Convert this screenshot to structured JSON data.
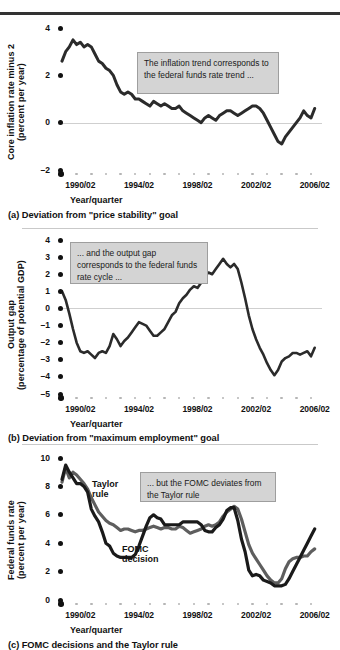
{
  "figure": {
    "panels": [
      {
        "id": "a",
        "caption": "(a) Deviation from \"price stability\" goal",
        "callout": "The inflation trend corresponds to the federal funds rate trend ...",
        "xaxis_title": "Year/quarter",
        "ylabel_line1": "Core inflation rate minus 2",
        "ylabel_line2": "(percent per year)"
      },
      {
        "id": "b",
        "caption": "(b) Deviation from \"maximum employment\" goal",
        "callout": "... and the output gap corresponds to the federal funds rate cycle ...",
        "xaxis_title": "Year/quarter",
        "ylabel_line1": "Output gap",
        "ylabel_line2": "(percentage of potential GDP)"
      },
      {
        "id": "c",
        "caption": "(c) FOMC decisions and the Taylor rule",
        "callout": "... but the FOMC deviates from the Taylor rule",
        "xaxis_title": "Year/quarter",
        "ylabel_line1": "Federal funds rate",
        "ylabel_line2": "(percent per year)",
        "label_taylor": "Taylor\nrule",
        "label_fomc": "FOMC\ndecision"
      }
    ]
  },
  "colors": {
    "series_dark": "#2b2b2b",
    "series_gray": "#5e5e5e",
    "callout_bg": "#d4d4d4",
    "callout_border": "#9e9e9e",
    "zero_line": "#cfcfcf",
    "tick_major": "#111111",
    "tick_minor": "#b5b5b5",
    "rule_top": "#333333",
    "rule_panel": "#c9c9c9"
  },
  "chart_data": [
    {
      "type": "line",
      "id": "panel-a",
      "title": "(a) Deviation from \"price stability\" goal",
      "xlabel": "Year/quarter",
      "ylabel": "Core inflation rate minus 2 (percent per year)",
      "ylim": [
        -2,
        4
      ],
      "yticks": [
        -2,
        0,
        2,
        4
      ],
      "xlim": [
        "1989/01",
        "2006/04"
      ],
      "xticks": [
        "1990/02",
        "1994/02",
        "1998/02",
        "2002/02",
        "2006/02"
      ],
      "grid": false,
      "zero_line": true,
      "annotation": "The inflation trend corresponds to the federal funds rate trend ...",
      "series": [
        {
          "name": "Core inflation rate minus 2",
          "color": "#2b2b2b",
          "x": [
            "1989/01",
            "1989/02",
            "1989/03",
            "1989/04",
            "1990/01",
            "1990/02",
            "1990/03",
            "1990/04",
            "1991/01",
            "1991/02",
            "1991/03",
            "1991/04",
            "1992/01",
            "1992/02",
            "1992/03",
            "1992/04",
            "1993/01",
            "1993/02",
            "1993/03",
            "1993/04",
            "1994/01",
            "1994/02",
            "1994/03",
            "1994/04",
            "1995/01",
            "1995/02",
            "1995/03",
            "1995/04",
            "1996/01",
            "1996/02",
            "1996/03",
            "1996/04",
            "1997/01",
            "1997/02",
            "1997/03",
            "1997/04",
            "1998/01",
            "1998/02",
            "1998/03",
            "1998/04",
            "1999/01",
            "1999/02",
            "1999/03",
            "1999/04",
            "2000/01",
            "2000/02",
            "2000/03",
            "2000/04",
            "2001/01",
            "2001/02",
            "2001/03",
            "2001/04",
            "2002/01",
            "2002/02",
            "2002/03",
            "2002/04",
            "2003/01",
            "2003/02",
            "2003/03",
            "2003/04",
            "2004/01",
            "2004/02",
            "2004/03",
            "2004/04",
            "2005/01",
            "2005/02",
            "2005/03",
            "2005/04",
            "2006/01",
            "2006/02"
          ],
          "values": [
            2.6,
            3.0,
            3.2,
            3.5,
            3.3,
            3.4,
            3.2,
            3.3,
            3.2,
            2.9,
            2.6,
            2.5,
            2.3,
            2.2,
            2.0,
            1.6,
            1.3,
            1.2,
            1.3,
            1.2,
            1.0,
            1.0,
            0.9,
            0.8,
            0.7,
            0.9,
            0.8,
            0.7,
            0.8,
            0.7,
            0.6,
            0.6,
            0.7,
            0.5,
            0.4,
            0.3,
            0.2,
            0.1,
            0.0,
            0.2,
            0.3,
            0.2,
            0.1,
            0.3,
            0.4,
            0.5,
            0.5,
            0.4,
            0.3,
            0.4,
            0.5,
            0.6,
            0.7,
            0.7,
            0.6,
            0.4,
            0.1,
            -0.2,
            -0.5,
            -0.8,
            -0.9,
            -0.6,
            -0.4,
            -0.2,
            0.0,
            0.2,
            0.5,
            0.3,
            0.2,
            0.6
          ]
        }
      ]
    },
    {
      "type": "line",
      "id": "panel-b",
      "title": "(b) Deviation from \"maximum employment\" goal",
      "xlabel": "Year/quarter",
      "ylabel": "Output gap (percentage of potential GDP)",
      "ylim": [
        -5,
        4
      ],
      "yticks": [
        -5,
        -4,
        -3,
        -2,
        -1,
        0,
        1,
        2,
        3,
        4
      ],
      "xlim": [
        "1989/01",
        "2006/04"
      ],
      "xticks": [
        "1990/02",
        "1994/02",
        "1998/02",
        "2002/02",
        "2006/02"
      ],
      "grid": false,
      "zero_line": true,
      "annotation": "... and the output gap corresponds to the federal funds rate cycle ...",
      "series": [
        {
          "name": "Output gap",
          "color": "#2b2b2b",
          "x": [
            "1989/01",
            "1989/02",
            "1989/03",
            "1989/04",
            "1990/01",
            "1990/02",
            "1990/03",
            "1990/04",
            "1991/01",
            "1991/02",
            "1991/03",
            "1991/04",
            "1992/01",
            "1992/02",
            "1992/03",
            "1992/04",
            "1993/01",
            "1993/02",
            "1993/03",
            "1993/04",
            "1994/01",
            "1994/02",
            "1994/03",
            "1994/04",
            "1995/01",
            "1995/02",
            "1995/03",
            "1995/04",
            "1996/01",
            "1996/02",
            "1996/03",
            "1996/04",
            "1997/01",
            "1997/02",
            "1997/03",
            "1997/04",
            "1998/01",
            "1998/02",
            "1998/03",
            "1998/04",
            "1999/01",
            "1999/02",
            "1999/03",
            "1999/04",
            "2000/01",
            "2000/02",
            "2000/03",
            "2000/04",
            "2001/01",
            "2001/02",
            "2001/03",
            "2001/04",
            "2002/01",
            "2002/02",
            "2002/03",
            "2002/04",
            "2003/01",
            "2003/02",
            "2003/03",
            "2003/04",
            "2004/01",
            "2004/02",
            "2004/03",
            "2004/04",
            "2005/01",
            "2005/02",
            "2005/03",
            "2005/04",
            "2006/01",
            "2006/02"
          ],
          "values": [
            1.0,
            0.5,
            -0.3,
            -1.2,
            -2.0,
            -2.5,
            -2.6,
            -2.5,
            -2.7,
            -2.9,
            -2.6,
            -2.5,
            -2.6,
            -2.2,
            -1.5,
            -1.8,
            -2.2,
            -1.9,
            -1.7,
            -1.4,
            -1.1,
            -0.8,
            -0.9,
            -1.0,
            -1.3,
            -1.6,
            -1.6,
            -1.4,
            -1.2,
            -0.8,
            -0.4,
            -0.2,
            0.3,
            0.6,
            0.8,
            1.1,
            1.3,
            1.2,
            1.5,
            1.9,
            2.1,
            2.0,
            2.3,
            2.6,
            2.9,
            2.6,
            2.4,
            2.6,
            2.3,
            1.5,
            0.6,
            -0.4,
            -1.2,
            -1.8,
            -2.3,
            -2.7,
            -3.2,
            -3.6,
            -3.9,
            -3.6,
            -3.1,
            -2.9,
            -2.8,
            -2.6,
            -2.6,
            -2.7,
            -2.6,
            -2.5,
            -2.8,
            -2.3
          ]
        }
      ]
    },
    {
      "type": "line",
      "id": "panel-c",
      "title": "(c) FOMC decisions and the Taylor rule",
      "xlabel": "Year/quarter",
      "ylabel": "Federal funds rate (percent per year)",
      "ylim": [
        0,
        10
      ],
      "yticks": [
        0,
        2,
        4,
        6,
        8,
        10
      ],
      "xlim": [
        "1989/01",
        "2006/04"
      ],
      "xticks": [
        "1990/02",
        "1994/02",
        "1998/02",
        "2002/02",
        "2006/02"
      ],
      "grid": false,
      "annotation": "... but the FOMC deviates from the Taylor rule",
      "series": [
        {
          "name": "Taylor rule",
          "color": "#5e5e5e",
          "x": [
            "1989/01",
            "1989/02",
            "1989/03",
            "1989/04",
            "1990/01",
            "1990/02",
            "1990/03",
            "1990/04",
            "1991/01",
            "1991/02",
            "1991/03",
            "1991/04",
            "1992/01",
            "1992/02",
            "1992/03",
            "1992/04",
            "1993/01",
            "1993/02",
            "1993/03",
            "1993/04",
            "1994/01",
            "1994/02",
            "1994/03",
            "1994/04",
            "1995/01",
            "1995/02",
            "1995/03",
            "1995/04",
            "1996/01",
            "1996/02",
            "1996/03",
            "1996/04",
            "1997/01",
            "1997/02",
            "1997/03",
            "1997/04",
            "1998/01",
            "1998/02",
            "1998/03",
            "1998/04",
            "1999/01",
            "1999/02",
            "1999/03",
            "1999/04",
            "2000/01",
            "2000/02",
            "2000/03",
            "2000/04",
            "2001/01",
            "2001/02",
            "2001/03",
            "2001/04",
            "2002/01",
            "2002/02",
            "2002/03",
            "2002/04",
            "2003/01",
            "2003/02",
            "2003/03",
            "2003/04",
            "2004/01",
            "2004/02",
            "2004/03",
            "2004/04",
            "2005/01",
            "2005/02",
            "2005/03",
            "2005/04",
            "2006/01",
            "2006/02"
          ],
          "values": [
            8.3,
            9.3,
            8.6,
            9.0,
            8.8,
            8.5,
            8.2,
            7.8,
            7.2,
            6.7,
            6.2,
            5.9,
            5.6,
            5.4,
            5.3,
            5.1,
            4.9,
            5.0,
            5.0,
            4.9,
            4.8,
            4.9,
            4.9,
            5.0,
            5.1,
            5.2,
            5.1,
            5.0,
            5.1,
            5.1,
            5.0,
            5.0,
            5.2,
            5.1,
            4.9,
            4.7,
            4.8,
            4.9,
            5.0,
            5.2,
            5.3,
            5.2,
            5.3,
            5.5,
            5.9,
            6.2,
            6.4,
            6.6,
            6.4,
            5.7,
            4.8,
            3.9,
            3.3,
            2.9,
            2.5,
            2.1,
            1.7,
            1.4,
            1.2,
            1.2,
            1.5,
            2.2,
            2.7,
            2.9,
            3.0,
            3.0,
            3.1,
            3.1,
            3.4,
            3.6
          ]
        },
        {
          "name": "FOMC decision",
          "color": "#1a1a1a",
          "x": [
            "1989/01",
            "1989/02",
            "1989/03",
            "1989/04",
            "1990/01",
            "1990/02",
            "1990/03",
            "1990/04",
            "1991/01",
            "1991/02",
            "1991/03",
            "1991/04",
            "1992/01",
            "1992/02",
            "1992/03",
            "1992/04",
            "1993/01",
            "1993/02",
            "1993/03",
            "1993/04",
            "1994/01",
            "1994/02",
            "1994/03",
            "1994/04",
            "1995/01",
            "1995/02",
            "1995/03",
            "1995/04",
            "1996/01",
            "1996/02",
            "1996/03",
            "1996/04",
            "1997/01",
            "1997/02",
            "1997/03",
            "1997/04",
            "1998/01",
            "1998/02",
            "1998/03",
            "1998/04",
            "1999/01",
            "1999/02",
            "1999/03",
            "1999/04",
            "2000/01",
            "2000/02",
            "2000/03",
            "2000/04",
            "2001/01",
            "2001/02",
            "2001/03",
            "2001/04",
            "2002/01",
            "2002/02",
            "2002/03",
            "2002/04",
            "2003/01",
            "2003/02",
            "2003/03",
            "2003/04",
            "2004/01",
            "2004/02",
            "2004/03",
            "2004/04",
            "2005/01",
            "2005/02",
            "2005/03",
            "2005/04",
            "2006/01",
            "2006/02"
          ],
          "values": [
            8.5,
            9.5,
            9.0,
            8.6,
            8.2,
            8.2,
            8.0,
            7.6,
            6.4,
            5.9,
            5.5,
            4.8,
            4.0,
            3.8,
            3.3,
            3.1,
            3.0,
            3.0,
            3.0,
            3.0,
            3.2,
            3.8,
            4.5,
            5.2,
            5.8,
            6.0,
            5.8,
            5.7,
            5.3,
            5.3,
            5.3,
            5.3,
            5.3,
            5.5,
            5.5,
            5.5,
            5.5,
            5.5,
            5.3,
            4.9,
            4.8,
            4.8,
            5.1,
            5.3,
            5.7,
            6.3,
            6.5,
            6.5,
            5.6,
            4.3,
            3.4,
            2.1,
            1.7,
            1.8,
            1.7,
            1.4,
            1.3,
            1.2,
            1.0,
            1.0,
            1.0,
            1.1,
            1.5,
            2.0,
            2.5,
            3.0,
            3.5,
            4.0,
            4.5,
            5.0
          ]
        }
      ]
    }
  ]
}
